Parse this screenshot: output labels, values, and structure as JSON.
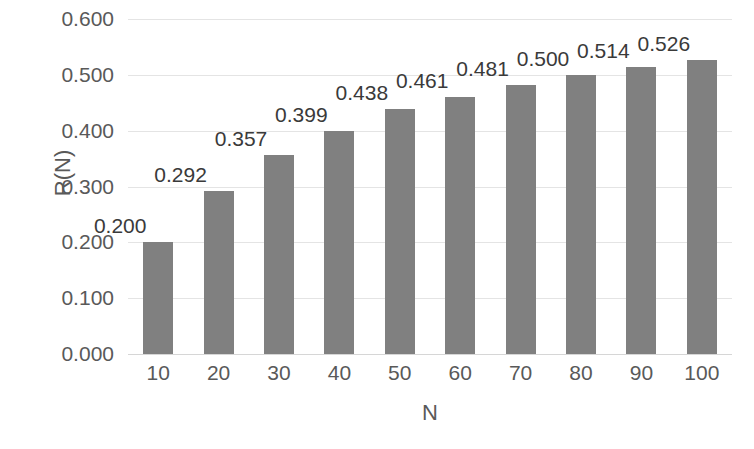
{
  "chart_data": {
    "type": "bar",
    "title": "",
    "xlabel": "N",
    "ylabel": "R(N)",
    "categories": [
      "10",
      "20",
      "30",
      "40",
      "50",
      "60",
      "70",
      "80",
      "90",
      "100"
    ],
    "values": [
      0.2,
      0.292,
      0.357,
      0.399,
      0.438,
      0.461,
      0.481,
      0.5,
      0.514,
      0.526
    ],
    "data_labels": [
      "0.200",
      "0.292",
      "0.357",
      "0.399",
      "0.438",
      "0.461",
      "0.481",
      "0.500",
      "0.514",
      "0.526"
    ],
    "ylim": [
      0.0,
      0.6
    ],
    "y_ticks": [
      0.0,
      0.1,
      0.2,
      0.3,
      0.4,
      0.5,
      0.6
    ],
    "y_tick_labels": [
      "0.000",
      "0.100",
      "0.200",
      "0.300",
      "0.400",
      "0.500",
      "0.600"
    ],
    "grid": true,
    "grid_axis": "y",
    "legend": false,
    "legend_position": "none",
    "series": [
      {
        "name": "R(N)",
        "values": [
          0.2,
          0.292,
          0.357,
          0.399,
          0.438,
          0.461,
          0.481,
          0.5,
          0.514,
          0.526
        ]
      }
    ],
    "colors": {
      "bar": "#808080",
      "gridline": "#e4e4e4",
      "baseline": "#d6d6d6",
      "tick_label": "#595959",
      "axis_title": "#595959",
      "data_label": "#3a3a3a",
      "background": "#ffffff"
    }
  }
}
